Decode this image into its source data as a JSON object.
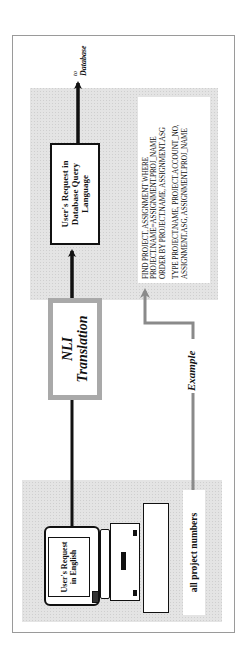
{
  "figure": {
    "orientation": "rotated -90deg (reads bottom-to-top)",
    "input_panel": {
      "monitor_text": "User's Request in English",
      "example_input": "all project numbers"
    },
    "translation": {
      "line1": "NLI",
      "line2": "Translation"
    },
    "output_panel": {
      "box_text": "User's Request in Database Query Language",
      "query_lines_1": [
        "FIND PROJECT, ASSIGNMENT WHERE",
        "PROJECT.NAME=ASSIGNMENT.PROJ_NAME",
        "ORDER BY PROJECT.NAME, ASSIGNMENT.ASG"
      ],
      "query_lines_2": [
        "TYPE PROJECT.NAME, PROJECT.ACCOUNT_NO,",
        "ASSIGNMENT.ASG, ASSIGNMENT.PROJ_NAME"
      ]
    },
    "example_label": "Example",
    "destination": {
      "to": "to",
      "label": "Database"
    },
    "colors": {
      "panel_gray": "#e4e4e4",
      "border_dark": "#111111",
      "nli_border": "#a9a9a9",
      "example_arrow": "#8a8a8a",
      "frame": "#9a9a9a"
    }
  }
}
